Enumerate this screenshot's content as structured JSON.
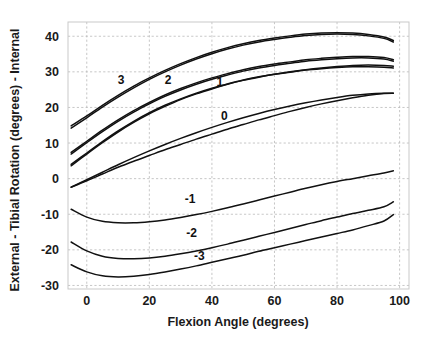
{
  "chart_data": {
    "type": "line",
    "title": "",
    "xlabel": "Flexion Angle (degrees)",
    "ylabel": "External  -  Tibial Rotation (degrees)  -  Internal",
    "xlim": [
      -6,
      103
    ],
    "ylim": [
      -31,
      44
    ],
    "xticks": [
      0,
      20,
      40,
      60,
      80,
      100
    ],
    "yticks": [
      40,
      30,
      20,
      10,
      0,
      -10,
      -20,
      -30
    ],
    "xtick_labels": [
      "0",
      "20",
      "40",
      "60",
      "80",
      "100"
    ],
    "ytick_labels": [
      "40",
      "30",
      "20",
      "10",
      "0",
      "-10",
      "-20",
      "-30"
    ],
    "grid": true,
    "legend_position": "inline-labels",
    "x": [
      -5,
      0,
      5,
      10,
      15,
      20,
      25,
      30,
      35,
      40,
      45,
      50,
      55,
      60,
      65,
      70,
      75,
      80,
      85,
      90,
      95,
      98
    ],
    "series": [
      {
        "name": "3",
        "label": "3",
        "label_x": 11,
        "label_y": 26.5,
        "values": [
          14.8,
          17.6,
          20.6,
          23.4,
          26.0,
          28.3,
          30.4,
          32.3,
          34.0,
          35.5,
          36.8,
          37.9,
          38.8,
          39.5,
          40.1,
          40.6,
          40.9,
          41.0,
          40.9,
          40.5,
          39.8,
          38.8
        ]
      },
      {
        "name": "3b",
        "label": "",
        "label_x": null,
        "label_y": null,
        "values": [
          14.2,
          17.1,
          20.1,
          22.9,
          25.5,
          27.9,
          30.0,
          31.9,
          33.6,
          35.1,
          36.4,
          37.5,
          38.4,
          39.1,
          39.7,
          40.2,
          40.5,
          40.6,
          40.5,
          40.1,
          39.4,
          38.4
        ]
      },
      {
        "name": "2",
        "label": "2",
        "label_x": 26,
        "label_y": 26.5,
        "values": [
          7.4,
          10.5,
          13.6,
          16.5,
          19.1,
          21.4,
          23.5,
          25.3,
          26.9,
          28.3,
          29.5,
          30.6,
          31.5,
          32.2,
          32.8,
          33.4,
          33.8,
          34.1,
          34.3,
          34.3,
          34.0,
          33.4
        ]
      },
      {
        "name": "2b",
        "label": "",
        "label_x": null,
        "label_y": null,
        "values": [
          6.9,
          10.1,
          13.2,
          16.1,
          18.7,
          21.0,
          23.1,
          24.9,
          26.5,
          27.9,
          29.1,
          30.2,
          31.1,
          31.8,
          32.4,
          33.0,
          33.4,
          33.7,
          33.9,
          33.9,
          33.6,
          33.0
        ]
      },
      {
        "name": "1",
        "label": "1",
        "label_x": 42.5,
        "label_y": 26,
        "values": [
          4.0,
          7.2,
          10.4,
          13.4,
          16.1,
          18.5,
          20.6,
          22.4,
          24.0,
          25.4,
          26.6,
          27.7,
          28.6,
          29.3,
          29.9,
          30.5,
          30.9,
          31.2,
          31.4,
          31.4,
          31.3,
          31.1
        ]
      },
      {
        "name": "1b",
        "label": "",
        "label_x": null,
        "label_y": null,
        "values": [
          3.6,
          6.9,
          10.1,
          13.1,
          15.8,
          18.2,
          20.3,
          22.2,
          23.8,
          25.2,
          26.5,
          27.6,
          28.5,
          29.3,
          30.0,
          30.6,
          31.1,
          31.5,
          31.8,
          31.9,
          31.8,
          31.6
        ]
      },
      {
        "name": "0",
        "label": "0",
        "label_x": 44,
        "label_y": 16.5,
        "values": [
          -2.4,
          -0.3,
          1.8,
          3.9,
          5.9,
          7.8,
          9.6,
          11.3,
          12.9,
          14.4,
          15.8,
          17.1,
          18.3,
          19.4,
          20.4,
          21.3,
          22.1,
          22.8,
          23.4,
          23.8,
          24.0,
          24.0
        ]
      },
      {
        "name": "0b",
        "label": "",
        "label_x": null,
        "label_y": null,
        "values": [
          -2.4,
          -0.6,
          1.3,
          3.2,
          4.9,
          6.5,
          8.1,
          9.6,
          11.1,
          12.5,
          13.9,
          15.2,
          16.5,
          17.7,
          18.9,
          20.0,
          21.0,
          21.9,
          22.7,
          23.4,
          23.9,
          24.0
        ]
      },
      {
        "name": "-1",
        "label": "-1",
        "label_x": 33,
        "label_y": -6.8,
        "values": [
          -8.6,
          -10.8,
          -12.0,
          -12.4,
          -12.4,
          -12.1,
          -11.6,
          -10.9,
          -10.1,
          -9.2,
          -8.2,
          -7.1,
          -6.0,
          -4.9,
          -3.8,
          -2.7,
          -1.7,
          -0.8,
          0.0,
          0.8,
          1.6,
          2.2
        ]
      },
      {
        "name": "-2",
        "label": "-2",
        "label_x": 33.5,
        "label_y": -16.5,
        "values": [
          -17.8,
          -20.3,
          -21.8,
          -22.4,
          -22.5,
          -22.3,
          -21.8,
          -21.1,
          -20.3,
          -19.4,
          -18.4,
          -17.3,
          -16.2,
          -15.1,
          -14.0,
          -12.9,
          -11.8,
          -10.8,
          -9.8,
          -8.9,
          -7.9,
          -6.5
        ]
      },
      {
        "name": "-3",
        "label": "-3",
        "label_x": 36,
        "label_y": -22.8,
        "values": [
          -24.2,
          -26.2,
          -27.3,
          -27.6,
          -27.4,
          -26.9,
          -26.2,
          -25.4,
          -24.5,
          -23.5,
          -22.5,
          -21.5,
          -20.4,
          -19.4,
          -18.4,
          -17.4,
          -16.4,
          -15.4,
          -14.4,
          -13.2,
          -11.9,
          -10.1
        ]
      }
    ]
  }
}
